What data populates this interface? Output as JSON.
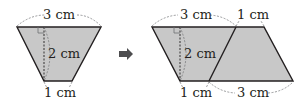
{
  "colors": {
    "fill": "#c8c8c8",
    "stroke": "#231f20",
    "dash": "#6d6e71",
    "arrow": "#4d4d4f"
  },
  "left_figure": {
    "shape": "trapezoid",
    "top_label": "3 cm",
    "height_label": "2 cm",
    "bottom_label": "1 cm"
  },
  "arrow": {
    "icon": "right-arrow-icon"
  },
  "right_figure": {
    "shape": "parallelogram",
    "top_left_label": "3 cm",
    "top_right_label": "1 cm",
    "height_label": "2 cm",
    "bottom_left_label": "1 cm",
    "bottom_right_label": "3 cm"
  }
}
